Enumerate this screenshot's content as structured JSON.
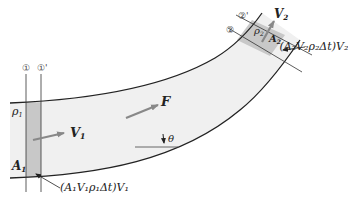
{
  "diagram": {
    "colors": {
      "pipe_fill": "#f0f0f0",
      "control_volume_fill": "#c8c8c8",
      "outline": "#222222",
      "arrow": "#888888"
    },
    "section_labels": {
      "s1": "①",
      "s1_prime": "①'",
      "s2": "②",
      "s2_prime": "②'"
    },
    "labels": {
      "rho1": "ρ",
      "rho1_sub": "1",
      "A1": "A",
      "A1_sub": "1",
      "V1": "V",
      "V1_sub": "1",
      "F": "F",
      "theta": "θ",
      "rho2": "ρ",
      "rho2_sub": "2",
      "A2": "A",
      "A2_sub": "2",
      "V2": "V",
      "V2_sub": "2",
      "momentum_in": "(A₁V₁ρ₁Δt)V₁",
      "momentum_out": "(A₂V₂ρ₂Δt)V₂"
    }
  }
}
